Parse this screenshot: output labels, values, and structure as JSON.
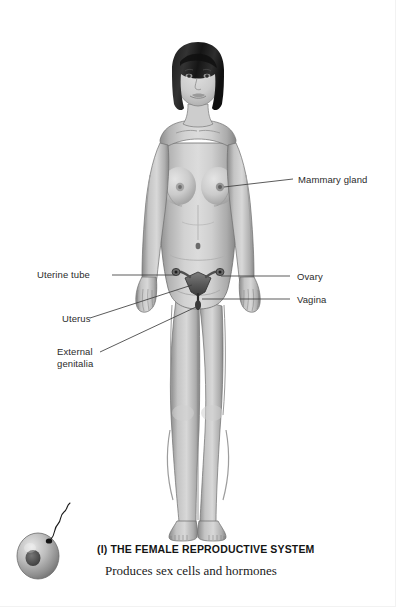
{
  "figure": {
    "title": "(l) THE FEMALE REPRODUCTIVE SYSTEM",
    "subtitle": "Produces sex cells and hormones",
    "style": "grayscale-anatomical-illustration",
    "background_color": "#ffffff",
    "label_color": "#2b2b2b",
    "leader_line_color": "#3a3a3a",
    "organ_overlay_color": "#4a4a4a"
  },
  "labels": [
    {
      "id": "mammary-gland",
      "text": "Mammary gland",
      "side": "right",
      "lines": 1
    },
    {
      "id": "uterine-tube",
      "text": "Uterine tube",
      "side": "left",
      "lines": 1
    },
    {
      "id": "uterus",
      "text": "Uterus",
      "side": "left",
      "lines": 1
    },
    {
      "id": "external-genitalia-1",
      "text": "External",
      "side": "left",
      "lines": 2
    },
    {
      "id": "external-genitalia-2",
      "text": "genitalia",
      "side": "left",
      "lines": 2
    },
    {
      "id": "ovary",
      "text": "Ovary",
      "side": "right",
      "lines": 1
    },
    {
      "id": "vagina",
      "text": "Vagina",
      "side": "right",
      "lines": 1
    }
  ],
  "icon": {
    "name": "ovum-with-sperm",
    "description": "ovum cell with nucleus and sperm cell"
  }
}
